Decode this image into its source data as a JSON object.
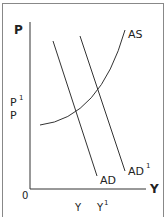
{
  "diagram": {
    "y_axis_label": "P",
    "x_axis_label": "Y",
    "origin_label": "0",
    "price_labels": {
      "p1": "P",
      "p1_sup": "1",
      "p": "P"
    },
    "output_labels": {
      "y": "Y",
      "y1": "Y",
      "y1_sup": "1"
    },
    "curves": {
      "as": "AS",
      "ad": "AD",
      "ad1": "AD",
      "ad1_sup": "1"
    }
  }
}
